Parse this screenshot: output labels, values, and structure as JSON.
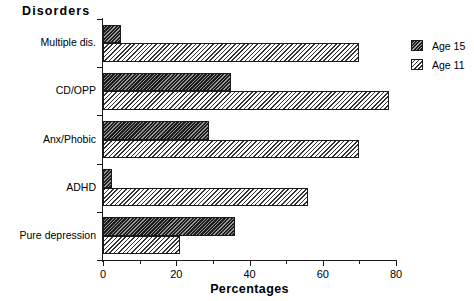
{
  "chart_data": {
    "type": "bar",
    "orientation": "horizontal",
    "title": "",
    "xlabel": "Percentages",
    "ylabel": "Disorders",
    "xlim": [
      0,
      80
    ],
    "xticks": [
      0,
      20,
      40,
      60,
      80
    ],
    "xtick_labels": [
      "0",
      "20",
      "40",
      "60",
      "80"
    ],
    "grid": false,
    "legend_position": "right-top",
    "categories": [
      "Multiple dis.",
      "CD/OPP",
      "Anx/Phobic",
      "ADHD",
      "Pure depression"
    ],
    "series": [
      {
        "name": "Age 15",
        "values": [
          5,
          35,
          29,
          2.5,
          36
        ],
        "color": "#1c1c1c",
        "hatch": "dark-diagonal"
      },
      {
        "name": "Age 11",
        "values": [
          70,
          78,
          70,
          56,
          21
        ],
        "color": "#ffffff",
        "hatch": "light-diagonal"
      }
    ]
  },
  "axes": {
    "y_title": "Disorders",
    "x_title": "Percentages",
    "category_labels": [
      "Multiple dis.",
      "CD/OPP",
      "Anx/Phobic",
      "ADHD",
      "Pure depression"
    ],
    "x_tick_labels": [
      "0",
      "20",
      "40",
      "60",
      "80"
    ]
  },
  "legend": {
    "items": [
      {
        "label": "Age 15",
        "swatch": "dark-hatch-swatch"
      },
      {
        "label": "Age 11",
        "swatch": "light-hatch-swatch"
      }
    ]
  }
}
